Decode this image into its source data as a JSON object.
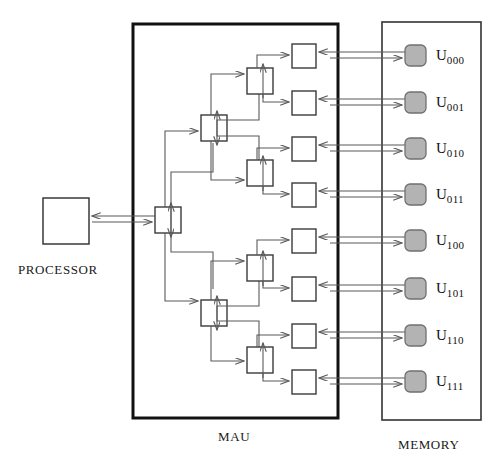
{
  "diagram": {
    "captions": {
      "processor": "PROCESSOR",
      "mau": "MAU",
      "memory": "MEMORY"
    },
    "colors": {
      "line": "#595959",
      "frame": "#111111",
      "box_stroke": "#3a3a3a",
      "memory_fill": "#b3b3b3",
      "memory_stroke": "#707070",
      "background": "#ffffff"
    },
    "processor": {
      "label": "PROCESSOR",
      "shape": "rectangle"
    },
    "mau": {
      "label": "MAU",
      "levels": [
        {
          "name": "root",
          "node_count": 1
        },
        {
          "name": "level-1",
          "node_count": 2
        },
        {
          "name": "level-2",
          "node_count": 4
        },
        {
          "name": "leaf",
          "node_count": 8
        }
      ],
      "total_switch_nodes": 15
    },
    "memory": {
      "label": "MEMORY",
      "modules": [
        {
          "name": "U",
          "index": "000"
        },
        {
          "name": "U",
          "index": "001"
        },
        {
          "name": "U",
          "index": "010"
        },
        {
          "name": "U",
          "index": "011"
        },
        {
          "name": "U",
          "index": "100"
        },
        {
          "name": "U",
          "index": "101"
        },
        {
          "name": "U",
          "index": "110"
        },
        {
          "name": "U",
          "index": "111"
        }
      ]
    }
  }
}
